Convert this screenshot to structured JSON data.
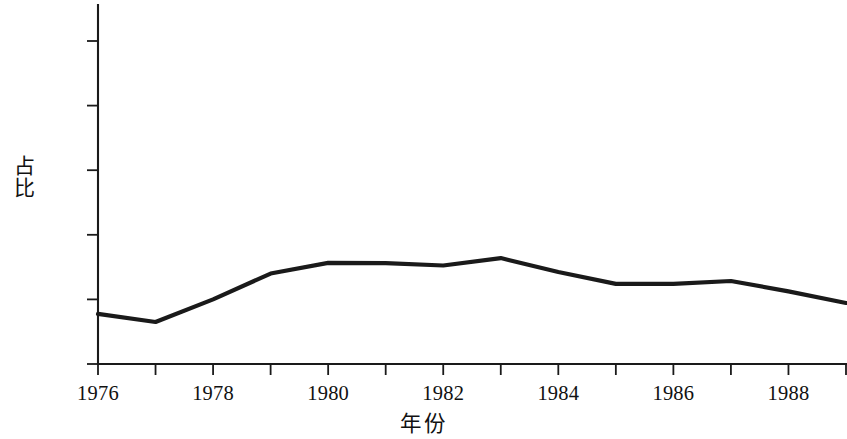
{
  "chart_data": {
    "type": "line",
    "title": "",
    "subtitle": "",
    "xlabel": "年份",
    "ylabel": "占比",
    "x": [
      1976,
      1977,
      1978,
      1979,
      1980,
      1981,
      1982,
      1983,
      1984,
      1985,
      1986,
      1987,
      1988,
      1989
    ],
    "values": [
      15.5,
      13.0,
      20.0,
      28.0,
      31.3,
      31.2,
      30.5,
      32.8,
      28.5,
      24.8,
      24.8,
      25.7,
      22.5,
      18.9
    ],
    "series": [
      {
        "name": "占比",
        "values": [
          15.5,
          13.0,
          20.0,
          28.0,
          31.3,
          31.2,
          30.5,
          32.8,
          28.5,
          24.8,
          24.8,
          25.7,
          22.5,
          18.9
        ]
      }
    ],
    "xlim": [
      1976,
      1989
    ],
    "ylim": [
      0,
      110
    ],
    "x_tick_values": [
      1976,
      1977,
      1978,
      1979,
      1980,
      1981,
      1982,
      1983,
      1984,
      1985,
      1986,
      1987,
      1988,
      1989
    ],
    "x_tick_labels": [
      "1976",
      "",
      "1978",
      "",
      "1980",
      "",
      "1982",
      "",
      "1984",
      "",
      "1986",
      "",
      "1988",
      ""
    ],
    "y_tick_values": [
      0,
      20,
      40,
      60,
      80,
      100
    ],
    "y_tick_labels": [
      "0",
      "20%",
      "40%",
      "60%",
      "80%",
      "100%"
    ],
    "grid": false,
    "legend": false,
    "legend_position": "none",
    "line_color": "#1a1a1a",
    "axis_color": "#1a1a1a",
    "background_color": "#ffffff",
    "annotations": []
  },
  "axis": {
    "y_title": "占比",
    "x_title": "年份"
  }
}
